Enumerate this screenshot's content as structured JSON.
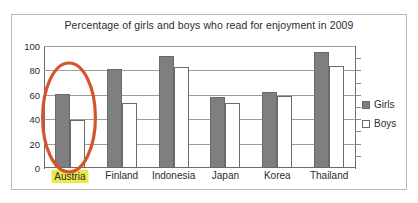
{
  "chart_data": {
    "type": "bar",
    "title": "Percentage of girls and boys who read for enjoyment in 2009",
    "xlabel": "",
    "ylabel": "",
    "ylim": [
      0,
      100
    ],
    "ytick_labels": [
      "100",
      "80",
      "60",
      "40",
      "20",
      "0"
    ],
    "ytick_values": [
      100,
      80,
      60,
      40,
      20,
      0
    ],
    "grid": true,
    "legend_position": "right",
    "categories": [
      "Austria",
      "Finland",
      "Indonesia",
      "Japan",
      "Korea",
      "Thailand"
    ],
    "series": [
      {
        "name": "Girls",
        "color": "#7f7f7f",
        "values": [
          61,
          81,
          92,
          58,
          62,
          95
        ]
      },
      {
        "name": "Boys",
        "color": "#ffffff",
        "values": [
          39,
          53,
          83,
          53,
          59,
          84
        ]
      }
    ],
    "annotations": [
      {
        "type": "ellipse",
        "target": "Austria",
        "color": "#d4552a",
        "description": "orange hand-drawn oval around the Austria bars"
      },
      {
        "type": "highlight",
        "target": "Austria",
        "color": "#e9e94b",
        "description": "yellow highlighter over the Austria category label"
      }
    ]
  },
  "legend": {
    "items": [
      {
        "label": "Girls",
        "swatch": "filled-gray-square"
      },
      {
        "label": "Boys",
        "swatch": "outlined-white-square"
      }
    ]
  }
}
